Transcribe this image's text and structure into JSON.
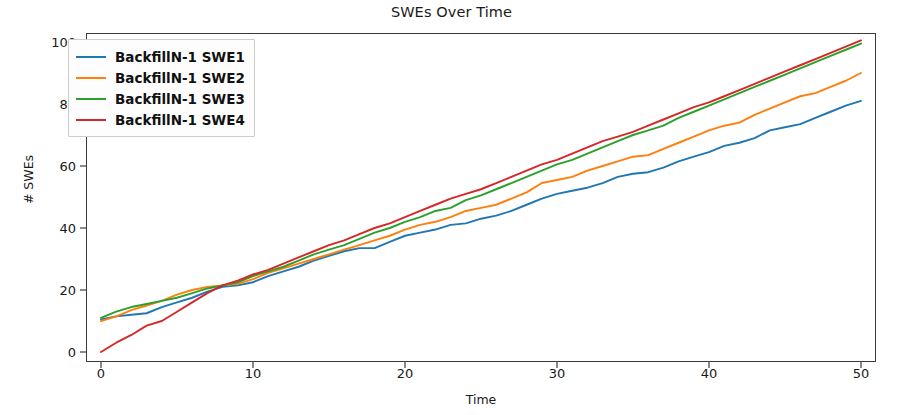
{
  "chart_data": {
    "type": "line",
    "title": "SWEs Over Time",
    "xlabel": "Time",
    "ylabel": "# SWEs",
    "xlim": [
      -2.5,
      52.5
    ],
    "ylim": [
      -6,
      107
    ],
    "xticks": [
      0,
      10,
      20,
      30,
      40,
      50
    ],
    "yticks": [
      0,
      20,
      40,
      60,
      80,
      100
    ],
    "grid": false,
    "legend_position": "upper left",
    "x": [
      0,
      1,
      2,
      3,
      4,
      5,
      6,
      7,
      8,
      9,
      10,
      11,
      12,
      13,
      14,
      15,
      16,
      17,
      18,
      19,
      20,
      21,
      22,
      23,
      24,
      25,
      26,
      27,
      28,
      29,
      30,
      31,
      32,
      33,
      34,
      35,
      36,
      37,
      38,
      39,
      40,
      41,
      42,
      43,
      44,
      45,
      46,
      47,
      48,
      49,
      50
    ],
    "series": [
      {
        "name": "BackfillN-1 SWE1",
        "color": "#1f77b4",
        "values": [
          10.5,
          11.5,
          12.0,
          12.5,
          14.5,
          16.0,
          17.5,
          19.5,
          21.0,
          21.5,
          22.5,
          24.5,
          26.0,
          27.5,
          29.5,
          31.0,
          32.5,
          33.5,
          33.5,
          35.5,
          37.5,
          38.5,
          39.5,
          41.0,
          41.5,
          43.0,
          44.0,
          45.5,
          47.5,
          49.5,
          51.0,
          52.0,
          53.0,
          54.5,
          56.5,
          57.5,
          58.0,
          59.5,
          61.5,
          63.0,
          64.5,
          66.5,
          67.5,
          69.0,
          71.5,
          72.5,
          73.5,
          75.5,
          77.5,
          79.5,
          81.0
        ]
      },
      {
        "name": "BackfillN-1 SWE2",
        "color": "#ff7f0e",
        "values": [
          10.0,
          11.5,
          13.5,
          15.0,
          16.5,
          18.5,
          20.0,
          21.0,
          21.5,
          22.0,
          23.5,
          25.5,
          27.0,
          28.5,
          30.0,
          31.5,
          33.0,
          34.5,
          36.0,
          37.5,
          39.5,
          41.0,
          42.0,
          43.5,
          45.5,
          46.5,
          47.5,
          49.5,
          51.5,
          54.5,
          55.5,
          56.5,
          58.5,
          60.0,
          61.5,
          63.0,
          63.5,
          65.5,
          67.5,
          69.5,
          71.5,
          73.0,
          74.0,
          76.5,
          78.5,
          80.5,
          82.5,
          83.5,
          85.5,
          87.5,
          90.0
        ]
      },
      {
        "name": "BackfillN-1 SWE3",
        "color": "#2ca02c",
        "values": [
          11.0,
          13.0,
          14.5,
          15.5,
          16.5,
          17.5,
          19.0,
          20.5,
          21.5,
          22.5,
          24.5,
          26.0,
          27.5,
          29.5,
          31.5,
          33.0,
          34.5,
          36.5,
          38.5,
          40.0,
          42.0,
          43.5,
          45.5,
          46.5,
          49.0,
          50.5,
          52.5,
          54.5,
          56.5,
          58.5,
          60.5,
          62.0,
          64.0,
          66.0,
          68.0,
          70.0,
          71.5,
          73.0,
          75.5,
          77.5,
          79.5,
          81.5,
          83.5,
          85.5,
          87.5,
          89.5,
          91.5,
          93.5,
          95.5,
          97.5,
          99.5
        ]
      },
      {
        "name": "BackfillN-1 SWE4",
        "color": "#d62728",
        "values": [
          0.0,
          3.0,
          5.5,
          8.5,
          10.0,
          13.0,
          16.0,
          19.0,
          21.5,
          23.0,
          25.0,
          26.5,
          28.5,
          30.5,
          32.5,
          34.5,
          36.0,
          38.0,
          40.0,
          41.5,
          43.5,
          45.5,
          47.5,
          49.5,
          51.0,
          52.5,
          54.5,
          56.5,
          58.5,
          60.5,
          62.0,
          64.0,
          66.0,
          68.0,
          69.5,
          71.0,
          73.0,
          75.0,
          77.0,
          79.0,
          80.5,
          82.5,
          84.5,
          86.5,
          88.5,
          90.5,
          92.5,
          94.5,
          96.5,
          98.5,
          100.5
        ]
      }
    ]
  },
  "legend": {
    "items": [
      {
        "label": "BackfillN-1 SWE1",
        "color": "#1f77b4"
      },
      {
        "label": "BackfillN-1 SWE2",
        "color": "#ff7f0e"
      },
      {
        "label": "BackfillN-1 SWE3",
        "color": "#2ca02c"
      },
      {
        "label": "BackfillN-1 SWE4",
        "color": "#d62728"
      }
    ]
  }
}
